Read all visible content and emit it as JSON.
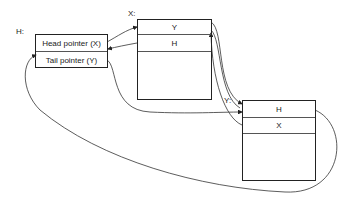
{
  "diagram": {
    "type": "linked-list pointer diagram",
    "header_node": {
      "label": "H:",
      "fields": [
        "Head pointer (X)",
        "Tail pointer (Y)"
      ]
    },
    "nodes": [
      {
        "label": "X:",
        "fields": [
          "Y",
          "H"
        ]
      },
      {
        "label": "Y:",
        "fields": [
          "H",
          "X"
        ]
      }
    ],
    "edges": [
      {
        "from": "H.Head pointer (X)",
        "to": "X"
      },
      {
        "from": "X.H",
        "to": "H"
      },
      {
        "from": "H.Tail pointer (Y)",
        "to": "Y"
      },
      {
        "from": "X.Y",
        "to": "Y"
      },
      {
        "from": "Y.X",
        "to": "X"
      },
      {
        "from": "Y.H",
        "to": "H"
      }
    ],
    "colors": {
      "line": "#222222",
      "background": "#ffffff"
    }
  }
}
